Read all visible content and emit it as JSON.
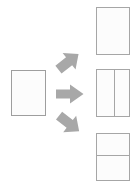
{
  "diagram": {
    "type": "page-layout-split-diagram",
    "background_color": "#ffffff",
    "page_border_color": "#a6a6a6",
    "page_fill_color": "#fcfcfc",
    "arrow_fill_color": "#a8a8a8",
    "source": {
      "name": "source-page",
      "label": "",
      "layout": "blank",
      "columns": 1,
      "rows": 1,
      "fill": "#ffffff"
    },
    "arrows": [
      {
        "name": "arrow-up-right",
        "direction": "up-right",
        "label": "",
        "color": "#a8a8a8"
      },
      {
        "name": "arrow-right",
        "direction": "right",
        "label": "",
        "color": "#a8a8a8"
      },
      {
        "name": "arrow-down-right",
        "direction": "down-right",
        "label": "",
        "color": "#a8a8a8"
      }
    ],
    "results": [
      {
        "name": "result-page-single",
        "label": "",
        "layout": "single",
        "columns": 1,
        "rows": 1,
        "divider": "none"
      },
      {
        "name": "result-page-two-columns",
        "label": "",
        "layout": "two-columns",
        "columns": 2,
        "rows": 1,
        "divider": "vertical",
        "divider_position_percent": 52
      },
      {
        "name": "result-page-two-rows",
        "label": "",
        "layout": "two-rows",
        "columns": 1,
        "rows": 2,
        "divider": "horizontal",
        "divider_position_percent": 46
      }
    ]
  }
}
